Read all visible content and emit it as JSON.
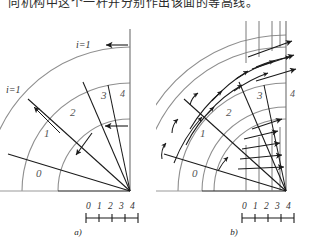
{
  "page": {
    "background": "#ffffff",
    "width": 312,
    "height": 250,
    "header_text": "向机构中这个一杆并分别作出该面的等高线。"
  },
  "colors": {
    "arc_gray": "#8f8f8f",
    "line_black": "#1a1a1a",
    "label_gray": "#555555",
    "axis_gray": "#9a9a9a",
    "text": "#222222"
  },
  "figures": [
    {
      "id": "a",
      "caption": "a)",
      "origin": {
        "x": 130,
        "y": 178
      },
      "radii": [
        36,
        72,
        108,
        144
      ],
      "band_labels": [
        "0",
        "1",
        "2",
        "3"
      ],
      "axis_label_top": "4",
      "callouts": [
        {
          "name": "i-equals-1-diagonal",
          "text": "i=1"
        },
        {
          "name": "i-equals-1-vertical",
          "text": "i=1"
        }
      ],
      "scale": {
        "ticks": [
          "0",
          "1",
          "2",
          "3",
          "4"
        ],
        "tick_count": 5
      }
    },
    {
      "id": "b",
      "caption": "b)",
      "origin": {
        "x": 130,
        "y": 178
      },
      "radii": [
        36,
        72,
        108,
        144
      ],
      "band_labels": [
        "0",
        "1",
        "2",
        "3"
      ],
      "axis_label_top": "4",
      "callouts": [],
      "scale": {
        "ticks": [
          "0",
          "1",
          "2",
          "3",
          "4"
        ],
        "tick_count": 5
      }
    }
  ]
}
